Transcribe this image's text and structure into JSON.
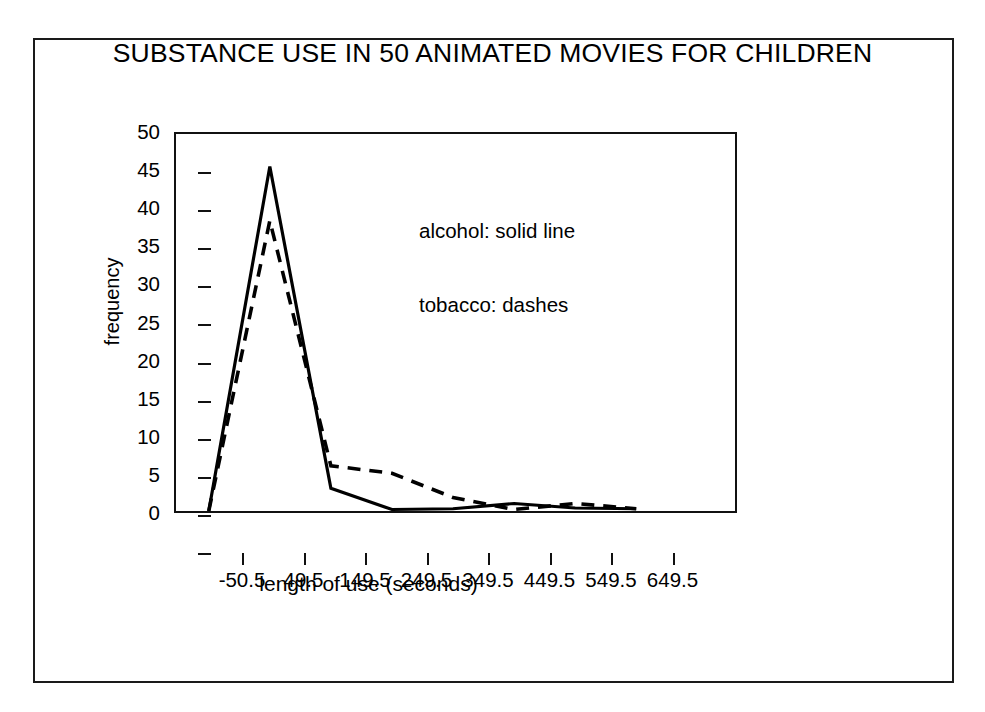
{
  "chart_data": {
    "type": "line",
    "title": "SUBSTANCE USE IN 50 ANIMATED MOVIES FOR CHILDREN",
    "xlabel": "length of use (seconds)",
    "ylabel": "frequency",
    "x": [
      -50.5,
      49.5,
      149.5,
      249.5,
      349.5,
      449.5,
      549.5,
      649.5
    ],
    "xtick_labels": [
      "-50.5",
      "49.5",
      "149.5",
      "249.5",
      "349.5",
      "449.5",
      "549.5",
      "649.5"
    ],
    "ytick_labels": [
      "50",
      "45",
      "40",
      "35",
      "30",
      "25",
      "20",
      "15",
      "10",
      "5",
      "0"
    ],
    "ytick_values": [
      50,
      45,
      40,
      35,
      30,
      25,
      20,
      15,
      10,
      5,
      0
    ],
    "ylim": [
      0,
      50
    ],
    "xlim": [
      -50.5,
      649.5
    ],
    "grid": false,
    "legend_position": "inside-upper-right",
    "series": [
      {
        "name": "alcohol",
        "style": "solid",
        "legend_text": "alcohol: solid line",
        "color": "#000000",
        "values": [
          0,
          45.7,
          3,
          0.2,
          0.3,
          1.0,
          0.4,
          0.3
        ]
      },
      {
        "name": "tobacco",
        "style": "dashed",
        "legend_text": "tobacco: dashes",
        "color": "#000000",
        "values": [
          0,
          38.5,
          6,
          5,
          1.8,
          0.2,
          1.0,
          0.3
        ]
      }
    ]
  },
  "figure": {
    "border_color": "#1a1a1a",
    "background": "#ffffff"
  }
}
